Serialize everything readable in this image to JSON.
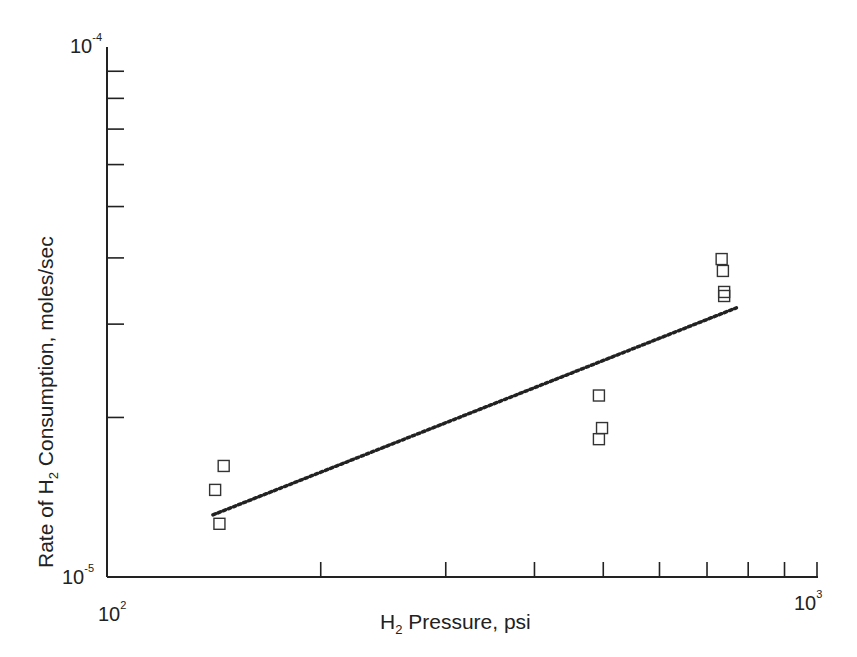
{
  "chart_data": {
    "type": "scatter",
    "title": "",
    "xlabel": "H2 Pressure, psi",
    "ylabel": "Rate of H2 Consumption, moles/sec",
    "xscale": "log",
    "yscale": "log",
    "xlim": [
      100,
      1000
    ],
    "ylim": [
      1e-05,
      0.0001
    ],
    "x_tick_labels": [
      "10^2",
      "10^3"
    ],
    "y_tick_labels": [
      "10^-5",
      "10^-4"
    ],
    "grid": false,
    "legend": null,
    "series": [
      {
        "name": "data",
        "marker": "open-square",
        "points": [
          {
            "x": 146,
            "y": 1.62e-05
          },
          {
            "x": 142,
            "y": 1.46e-05
          },
          {
            "x": 144,
            "y": 1.26e-05
          },
          {
            "x": 493,
            "y": 2.2e-05
          },
          {
            "x": 498,
            "y": 1.91e-05
          },
          {
            "x": 493,
            "y": 1.82e-05
          },
          {
            "x": 734,
            "y": 3.98e-05
          },
          {
            "x": 737,
            "y": 3.78e-05
          },
          {
            "x": 740,
            "y": 3.45e-05
          },
          {
            "x": 740,
            "y": 3.39e-05
          }
        ]
      },
      {
        "name": "fit",
        "style": "dotted-line",
        "points": [
          {
            "x": 141,
            "y": 1.31e-05
          },
          {
            "x": 770,
            "y": 3.22e-05
          }
        ]
      }
    ]
  },
  "labels": {
    "x_axis_prefix": "H",
    "x_axis_sub": "2",
    "x_axis_suffix": " Pressure, psi",
    "y_axis_prefix": "Rate of H",
    "y_axis_sub": "2",
    "y_axis_suffix": " Consumption, moles/sec",
    "x_min_base": "10",
    "x_min_exp": "2",
    "x_max_base": "10",
    "x_max_exp": "3",
    "y_min_base": "10",
    "y_min_exp": "-5",
    "y_max_base": "10",
    "y_max_exp": "-4"
  }
}
